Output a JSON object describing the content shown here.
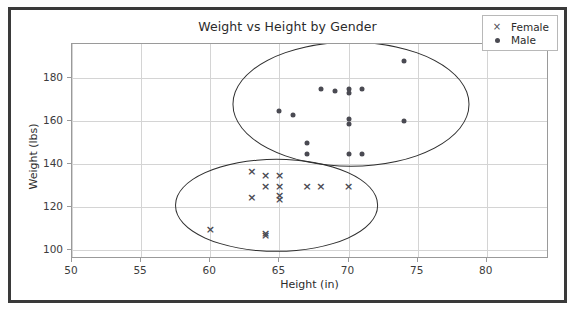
{
  "chart_data": {
    "type": "scatter",
    "title": "Weight vs Height by Gender",
    "xlabel": "Height (in)",
    "ylabel": "Weight (lbs)",
    "xlim": [
      50,
      84.5
    ],
    "ylim": [
      96,
      196
    ],
    "xticks": [
      50,
      55,
      60,
      65,
      70,
      75,
      80
    ],
    "yticks": [
      100,
      120,
      140,
      160,
      180
    ],
    "grid": true,
    "legend_position": "upper right",
    "series": [
      {
        "name": "Female",
        "marker": "x",
        "color": "#4a4a52",
        "points": [
          [
            60,
            110
          ],
          [
            63,
            137
          ],
          [
            63,
            125
          ],
          [
            64,
            135
          ],
          [
            64,
            130
          ],
          [
            64,
            108
          ],
          [
            64,
            107
          ],
          [
            65,
            135
          ],
          [
            65,
            130
          ],
          [
            65,
            126
          ],
          [
            65,
            124
          ],
          [
            67,
            130
          ],
          [
            68,
            130
          ],
          [
            70,
            130
          ]
        ]
      },
      {
        "name": "Male",
        "marker": "o",
        "color": "#4a4a52",
        "points": [
          [
            65,
            165
          ],
          [
            66,
            163
          ],
          [
            67,
            150
          ],
          [
            67,
            145
          ],
          [
            68,
            175
          ],
          [
            69,
            174
          ],
          [
            70,
            175
          ],
          [
            70,
            173
          ],
          [
            70,
            161
          ],
          [
            70,
            159
          ],
          [
            70,
            145
          ],
          [
            71,
            175
          ],
          [
            71,
            145
          ],
          [
            74,
            188
          ],
          [
            74,
            160
          ]
        ]
      }
    ],
    "annotations": [
      {
        "name": "male-cluster-ellipse",
        "shape": "ellipse",
        "center": [
          70.2,
          168
        ],
        "width": 17.0,
        "height": 57
      },
      {
        "name": "female-cluster-ellipse",
        "shape": "ellipse",
        "center": [
          64.8,
          121
        ],
        "width": 14.6,
        "height": 42
      }
    ]
  },
  "legend": {
    "entries": [
      {
        "label": "Female",
        "symbol": "x"
      },
      {
        "label": "Male",
        "symbol": "dot"
      }
    ]
  }
}
